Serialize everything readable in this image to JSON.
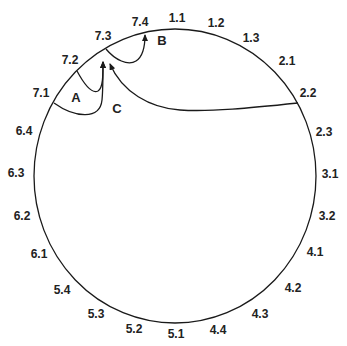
{
  "diagram": {
    "type": "ring-of-states",
    "stroke_color": "#1a1a1a",
    "ring_labels": [
      {
        "text": "1.1",
        "x": 177,
        "y": 22
      },
      {
        "text": "1.2",
        "x": 216,
        "y": 27
      },
      {
        "text": "1.3",
        "x": 251,
        "y": 42
      },
      {
        "text": "2.1",
        "x": 287,
        "y": 65
      },
      {
        "text": "2.2",
        "x": 308,
        "y": 97
      },
      {
        "text": "2.3",
        "x": 324,
        "y": 136
      },
      {
        "text": "3.1",
        "x": 330,
        "y": 178
      },
      {
        "text": "3.2",
        "x": 327,
        "y": 220
      },
      {
        "text": "4.1",
        "x": 315,
        "y": 256
      },
      {
        "text": "4.2",
        "x": 293,
        "y": 292
      },
      {
        "text": "4.3",
        "x": 260,
        "y": 318
      },
      {
        "text": "4.4",
        "x": 218,
        "y": 334
      },
      {
        "text": "5.1",
        "x": 176,
        "y": 338
      },
      {
        "text": "5.2",
        "x": 134,
        "y": 333
      },
      {
        "text": "5.3",
        "x": 96,
        "y": 318
      },
      {
        "text": "5.4",
        "x": 62,
        "y": 294
      },
      {
        "text": "6.1",
        "x": 39,
        "y": 258
      },
      {
        "text": "6.2",
        "x": 22,
        "y": 220
      },
      {
        "text": "6.3",
        "x": 16,
        "y": 177
      },
      {
        "text": "6.4",
        "x": 24,
        "y": 135
      },
      {
        "text": "7.1",
        "x": 41,
        "y": 97
      },
      {
        "text": "7.2",
        "x": 70,
        "y": 64
      },
      {
        "text": "7.3",
        "x": 103,
        "y": 40
      },
      {
        "text": "7.4",
        "x": 140,
        "y": 26
      }
    ],
    "annotations": [
      {
        "text": "A",
        "x": 76,
        "y": 102
      },
      {
        "text": "B",
        "x": 162,
        "y": 45
      },
      {
        "text": "C",
        "x": 117,
        "y": 113
      }
    ]
  }
}
